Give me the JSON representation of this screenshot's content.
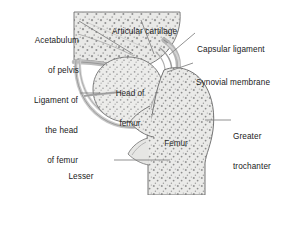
{
  "figure": {
    "colors": {
      "bone_fill": "#e8e8e6",
      "bone_stipple": "#8e8e8e",
      "cartilage": "#cfcfcf",
      "capsule": "#b9b9b9",
      "outline": "#6f6f6f",
      "leader": "#7a7a7a",
      "text": "#1a1a1a",
      "background": "#ffffff"
    }
  },
  "labels": {
    "acetabulum": {
      "line1": "Acetabulum",
      "line2": "of pelvis"
    },
    "articular_cartilage": {
      "line1": "Articular cartilage"
    },
    "capsular_ligament": {
      "line1": "Capsular ligament"
    },
    "synovial_membrane": {
      "line1": "Synovial membrane"
    },
    "ligament_of_head": {
      "line1": "Ligament of",
      "line2": "the head",
      "line3": "of femur"
    },
    "greater_trochanter": {
      "line1": "Greater",
      "line2": "trochanter"
    },
    "lesser_trochanter": {
      "line1": "Lesser",
      "line2": "trochanter"
    },
    "head_of_femur": {
      "line1": "Head of",
      "line2": "femur"
    },
    "femur": {
      "line1": "Femur"
    }
  }
}
